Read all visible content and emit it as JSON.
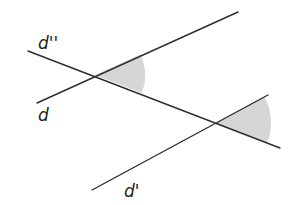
{
  "diagram": {
    "colors": {
      "line": "#2e2e2e",
      "angle_fill": "#d6d6d6",
      "background": "#ffffff"
    },
    "lines": [
      {
        "id": "d_double_prime",
        "label": "d''",
        "x1": 28,
        "y1": 51,
        "x2": 280,
        "y2": 148
      },
      {
        "id": "d",
        "label": "d",
        "x1": 37,
        "y1": 103,
        "x2": 238,
        "y2": 12
      },
      {
        "id": "d_prime",
        "label": "d'",
        "x1": 92,
        "y1": 190,
        "x2": 268,
        "y2": 95
      }
    ],
    "labels": [
      {
        "text": "d''",
        "x": 38,
        "y": 49
      },
      {
        "text": "d",
        "x": 38,
        "y": 121
      },
      {
        "text": "d'",
        "x": 124,
        "y": 197
      }
    ],
    "angles": [
      {
        "name": "angle-at-d-intersection",
        "cx": 95,
        "cy": 75,
        "r": 50
      },
      {
        "name": "angle-at-d-prime-intersection",
        "cx": 215,
        "cy": 123,
        "r": 56
      }
    ]
  }
}
